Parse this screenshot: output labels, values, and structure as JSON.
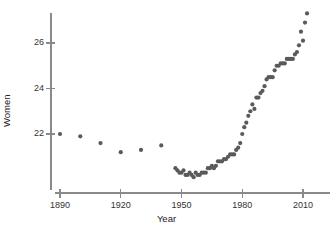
{
  "chart_data": {
    "type": "scatter",
    "title": "",
    "xlabel": "Year",
    "ylabel": "Women",
    "xlim": [
      1884,
      2014
    ],
    "ylim": [
      19.85,
      27.7
    ],
    "grid": false,
    "legend": null,
    "marker": {
      "shape": "circle",
      "color": "#5a5a5a",
      "size_px": 4.2
    },
    "axis_color": "#8a8a8a",
    "xticks": [
      1890,
      1920,
      1950,
      1980,
      2010
    ],
    "xtick_labels": [
      "1890",
      "1920",
      "1950",
      "1980",
      "2010"
    ],
    "yticks": [
      22,
      24,
      26
    ],
    "ytick_labels": [
      "22",
      "24",
      "26"
    ],
    "x": [
      1890,
      1900,
      1910,
      1920,
      1930,
      1940,
      1947,
      1948,
      1949,
      1950,
      1951,
      1952,
      1953,
      1954,
      1955,
      1956,
      1957,
      1958,
      1959,
      1960,
      1961,
      1962,
      1963,
      1964,
      1965,
      1966,
      1967,
      1968,
      1969,
      1970,
      1971,
      1972,
      1973,
      1974,
      1975,
      1976,
      1977,
      1978,
      1979,
      1980,
      1981,
      1982,
      1983,
      1984,
      1985,
      1986,
      1987,
      1988,
      1989,
      1990,
      1991,
      1992,
      1993,
      1994,
      1995,
      1996,
      1997,
      1998,
      1999,
      2000,
      2001,
      2002,
      2003,
      2004,
      2005,
      2006,
      2007,
      2008,
      2009,
      2010,
      2011,
      2012
    ],
    "y": [
      22.0,
      21.9,
      21.6,
      21.2,
      21.3,
      21.5,
      20.5,
      20.4,
      20.3,
      20.3,
      20.4,
      20.2,
      20.2,
      20.3,
      20.2,
      20.1,
      20.3,
      20.2,
      20.2,
      20.3,
      20.3,
      20.3,
      20.5,
      20.5,
      20.6,
      20.5,
      20.6,
      20.8,
      20.8,
      20.8,
      20.9,
      20.9,
      21.0,
      21.1,
      21.1,
      21.1,
      21.3,
      21.4,
      21.6,
      22.0,
      22.3,
      22.5,
      22.8,
      23.0,
      23.3,
      23.1,
      23.6,
      23.6,
      23.8,
      23.9,
      24.1,
      24.4,
      24.5,
      24.5,
      24.5,
      24.8,
      25.0,
      25.0,
      25.1,
      25.1,
      25.1,
      25.3,
      25.3,
      25.3,
      25.3,
      25.5,
      25.6,
      25.9,
      26.5,
      26.1,
      26.9,
      27.3
    ],
    "n_points": 73,
    "topmost_point": {
      "x": 2012,
      "y": 27.3
    },
    "minimum_point": {
      "x": 1956,
      "y": 20.1
    }
  }
}
